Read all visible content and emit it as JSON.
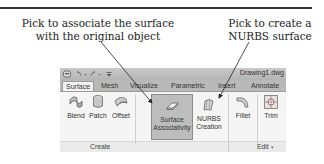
{
  "callouts": {
    "left": {
      "line1": "Pick to associate the surface",
      "line2": "with the original object"
    },
    "right": {
      "line1": "Pick to create a",
      "line2": "NURBS surface"
    }
  },
  "quick_access": {
    "icons": [
      "save-icon",
      "undo-icon",
      "dropdown-icon",
      "redo-icon",
      "dropdown-icon",
      "customize-icon"
    ],
    "document_title": "Drawing1.dwg"
  },
  "tabs": [
    {
      "label": "Surface",
      "active": true
    },
    {
      "label": "Mesh",
      "active": false
    },
    {
      "label": "Visualize",
      "active": false
    },
    {
      "label": "Parametric",
      "active": false
    },
    {
      "label": "Insert",
      "active": false
    },
    {
      "label": "Annotate",
      "active": false
    }
  ],
  "ribbon": {
    "create_panel": {
      "label": "Create",
      "buttons": [
        {
          "label": "Blend",
          "icon": "blend-icon"
        },
        {
          "label": "Patch",
          "icon": "patch-icon"
        },
        {
          "label": "Offset",
          "icon": "offset-icon"
        },
        {
          "label_line1": "Surface",
          "label_line2": "Associativity",
          "icon": "surface-associativity-icon",
          "selected": true
        },
        {
          "label_line1": "NURBS",
          "label_line2": "Creation",
          "icon": "nurbs-creation-icon"
        }
      ]
    },
    "edit_panel": {
      "label": "Edit",
      "expand_icon": "dropdown-icon",
      "buttons": [
        {
          "label": "Fillet",
          "icon": "fillet-icon"
        },
        {
          "label": "Trim",
          "icon": "trim-icon"
        }
      ]
    }
  },
  "colors": {
    "ribbon_bg": "#f5f5f5",
    "tab_bar_bg": "#b9b9b9",
    "selected_button_bg": "#bdbdbd",
    "leader_line": "#222222"
  }
}
